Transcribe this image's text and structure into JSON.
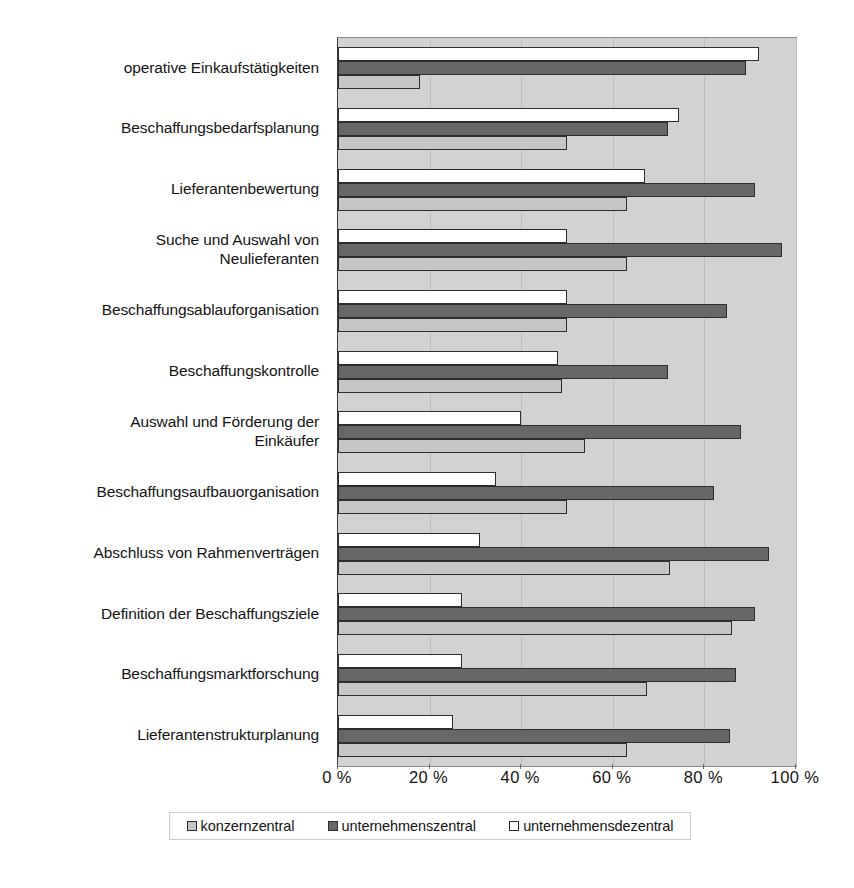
{
  "chart_data": {
    "type": "bar",
    "orientation": "horizontal",
    "title": "",
    "xlabel": "",
    "ylabel": "",
    "xlim": [
      0,
      100
    ],
    "xticks": [
      0,
      20,
      40,
      60,
      80,
      100
    ],
    "xtick_labels": [
      "0 %",
      "20 %",
      "40 %",
      "60 %",
      "80 %",
      "100 %"
    ],
    "grid": true,
    "legend_position": "bottom",
    "categories": [
      "operative Einkaufstätigkeiten",
      "Beschaffungsbedarfsplanung",
      "Lieferantenbewertung",
      "Suche und Auswahl von\nNeulieferanten",
      "Beschaffungsablauforganisation",
      "Beschaffungskontrolle",
      "Auswahl und Förderung der\nEinkäufer",
      "Beschaffungsaufbauorganisation",
      "Abschluss von Rahmenverträgen",
      "Definition der Beschaffungsziele",
      "Beschaffungsmarktforschung",
      "Lieferantenstrukturplanung"
    ],
    "series": [
      {
        "name": "unternehmensdezentral",
        "color": "#ffffff",
        "values": [
          92,
          74.5,
          67,
          50,
          50,
          48,
          40,
          34.5,
          31,
          27,
          27,
          25
        ]
      },
      {
        "name": "unternehmenszentral",
        "color": "#676767",
        "values": [
          89,
          72,
          91,
          97,
          85,
          72,
          88,
          82,
          94,
          91,
          87,
          85.5
        ]
      },
      {
        "name": "konzernzentral",
        "color": "#c6c6c6",
        "values": [
          18,
          50,
          63,
          63,
          50,
          49,
          54,
          50,
          72.5,
          86,
          67.5,
          63
        ]
      }
    ],
    "legend": [
      {
        "label": "konzernzentral",
        "swatch": "light-gray"
      },
      {
        "label": "unternehmenszentral",
        "swatch": "dark-gray"
      },
      {
        "label": "unternehmensdezentral",
        "swatch": "white"
      }
    ],
    "colors": {
      "plot_background": "#d2d2d2",
      "konzernzentral": "#c6c6c6",
      "unternehmenszentral": "#676767",
      "unternehmensdezentral": "#ffffff",
      "bar_outline": "#2d2d2d",
      "gridline": "#bdbdbd"
    }
  }
}
